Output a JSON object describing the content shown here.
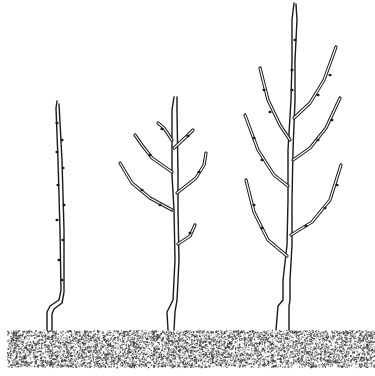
{
  "illustration": {
    "title": "Three young tree saplings at successive growth stages",
    "background_color": "#ffffff",
    "line_color": "#1a1a1a",
    "ground": {
      "label": "stippled soil",
      "x": 7,
      "y": 330,
      "width": 368,
      "height": 37,
      "dot_color": "#333333"
    },
    "trees": [
      {
        "label": "one-year whip (unbranched)",
        "trunk": "M57 101 L56 108 L58 160 L60 230 L61 290 L59 300 L50 306 L47 312 L47 330",
        "trunk_inner": "M59 104 L62 160 L64 230 L64 292 L62 303 L54 309 L52 314 L52 330",
        "branches": [],
        "buds": [
          [
            57,
            123
          ],
          [
            62,
            140
          ],
          [
            57,
            152
          ],
          [
            63,
            168
          ],
          [
            58,
            185
          ],
          [
            64,
            205
          ],
          [
            57,
            220
          ],
          [
            63,
            240
          ],
          [
            59,
            260
          ],
          [
            62,
            280
          ]
        ]
      },
      {
        "label": "two-year tree with side branches",
        "trunk": "M174 97 L172 110 L172 175 L174 210 L175 260 L173 300 L167 312 L168 330",
        "trunk_inner": "M177 97 L177 110 L178 175 L178 210 L179 260 L177 300 L175 312 L174 330",
        "branches": [
          "M172 140 L164 128 L158 123",
          "M174 148 L186 137 L193 130",
          "M172 172 L152 158 L142 145 L135 135",
          "M177 193 L196 178 L204 165 L206 153",
          "M172 210 L150 198 L132 183 L120 163",
          "M178 244 L190 236 L195 225"
        ],
        "buds": [
          [
            162,
            129
          ],
          [
            188,
            136
          ],
          [
            150,
            155
          ],
          [
            199,
            172
          ],
          [
            142,
            190
          ],
          [
            160,
            205
          ],
          [
            190,
            233
          ]
        ]
      },
      {
        "label": "three-year tree with developed scaffold",
        "trunk": "M294 3 L292 20 L292 60 L291 100 L288 150 L288 200 L287 245 L283 280 L283 300 L278 306 L276 330",
        "trunk_inner": "M296 4 L297 20 L295 60 L295 100 L293 150 L292 200 L292 245 L290 280 L290 300 L289 306 L289 330",
        "branches": [
          "M294 118 L310 103 L324 80 L336 47",
          "M290 140 L280 125 L268 100 L260 68",
          "M293 160 L310 148 L326 128 L340 98",
          "M288 186 L274 175 L258 150 L245 115",
          "M291 235 L312 222 L330 200 L341 165",
          "M287 256 L268 240 L254 212 L246 180"
        ],
        "buds": [
          [
            295,
            40
          ],
          [
            292,
            70
          ],
          [
            292,
            90
          ],
          [
            318,
            95
          ],
          [
            330,
            75
          ],
          [
            270,
            112
          ],
          [
            264,
            90
          ],
          [
            318,
            140
          ],
          [
            332,
            120
          ],
          [
            262,
            160
          ],
          [
            254,
            138
          ],
          [
            306,
            226
          ],
          [
            325,
            208
          ],
          [
            337,
            185
          ],
          [
            262,
            228
          ],
          [
            254,
            205
          ]
        ]
      }
    ]
  }
}
